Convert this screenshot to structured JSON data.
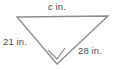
{
  "figure": {
    "type": "right-triangle",
    "background_color": "#ffffff",
    "stroke_color": "#8c8c8c",
    "text_color": "#4a4a4a",
    "vertices": {
      "top_left": {
        "x": 17,
        "y": 17
      },
      "top_right": {
        "x": 108,
        "y": 16
      },
      "bottom": {
        "x": 57,
        "y": 64
      }
    },
    "right_angle_mark": {
      "at_vertex": "bottom",
      "points": "48,50 57,59 65,48"
    },
    "labels": {
      "hypotenuse": {
        "variable": "c",
        "unit": "in."
      },
      "leg_left": {
        "value": "21",
        "unit": "in."
      },
      "leg_right": {
        "value": "28",
        "unit": "in."
      }
    }
  }
}
